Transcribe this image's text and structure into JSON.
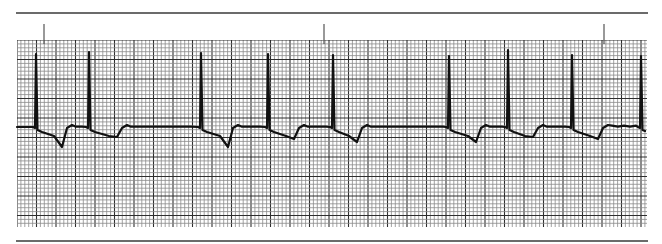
{
  "figure": {
    "type": "ecg-rhythm-strip",
    "colors": {
      "grid_minor": "#8a8a8a",
      "grid_major": "#2e2e2e",
      "trace": "#111111",
      "rule": "#6b6b6b",
      "paper": "#ffffff"
    },
    "time_markers_x": [
      44,
      324,
      604
    ],
    "beats": [
      {
        "x": 36,
        "peak_y": 54,
        "trough_x": 62,
        "trough_y": 147
      },
      {
        "x": 89,
        "peak_y": 52,
        "trough_x": 117,
        "trough_y": 137
      },
      {
        "x": 201,
        "peak_y": 53,
        "trough_x": 228,
        "trough_y": 147
      },
      {
        "x": 268,
        "peak_y": 54,
        "trough_x": 294,
        "trough_y": 139
      },
      {
        "x": 333,
        "peak_y": 55,
        "trough_x": 357,
        "trough_y": 142
      },
      {
        "x": 449,
        "peak_y": 56,
        "trough_x": 476,
        "trough_y": 142
      },
      {
        "x": 508,
        "peak_y": 50,
        "trough_x": 533,
        "trough_y": 137
      },
      {
        "x": 572,
        "peak_y": 55,
        "trough_x": 598,
        "trough_y": 139
      },
      {
        "x": 641,
        "peak_y": 56,
        "trough_x": null,
        "trough_y": null
      }
    ],
    "baseline_y": 127
  }
}
